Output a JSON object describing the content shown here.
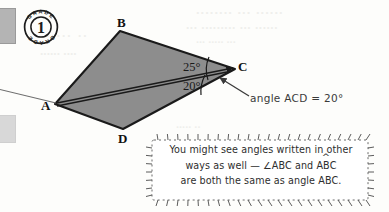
{
  "page": {
    "width": 389,
    "height": 212,
    "background_color": "#fdfdfb"
  },
  "badge": {
    "name": "grade-badge",
    "number": "1",
    "arc_text_top": "GRADE",
    "arc_text_bottom": "GRADE",
    "color": "#1c1c1c"
  },
  "diagram": {
    "type": "quadrilateral-angles",
    "fill_color": "#8d8d8d",
    "stroke_color": "#1a1a1a",
    "vertices": [
      {
        "label": "A",
        "x": 55,
        "y": 104
      },
      {
        "label": "B",
        "x": 120,
        "y": 31
      },
      {
        "label": "C",
        "x": 235,
        "y": 69
      },
      {
        "label": "D",
        "x": 123,
        "y": 129
      }
    ],
    "vertex_labels": {
      "A": "A",
      "B": "B",
      "C": "C",
      "D": "D"
    },
    "angles": [
      {
        "name": "angle-BCA",
        "value": "25°",
        "arc_at": "C"
      },
      {
        "name": "angle-ACD",
        "value": "20°",
        "arc_at": "C"
      }
    ],
    "rays": [
      {
        "name": "ray-A-to-C-upper",
        "from": "A",
        "to": "C",
        "arrowhead": true
      },
      {
        "name": "ray-A-to-C-lower",
        "from": "A",
        "to": "C",
        "arrowhead": false
      }
    ]
  },
  "annotations": {
    "acd_note": "angle ACD = 20°",
    "pointer_arrow": "arrow-to-angle-ACD"
  },
  "callout": {
    "line1": "You might see angles written in other",
    "line2_pre": "ways as well — ∠ABC and A",
    "line2_accent": "B",
    "line2_post": "C",
    "line3": "are both the same as angle ABC.",
    "border_style": "dashed-burst"
  },
  "bleed_through": {
    "line1": "........ ... ......",
    "line2": "... ......... ... ......",
    "line3": "... ..... ...",
    "line4": ". ... ..",
    "line5": "...... ....",
    "line6": "..... ..",
    "line7": "..... ..."
  }
}
